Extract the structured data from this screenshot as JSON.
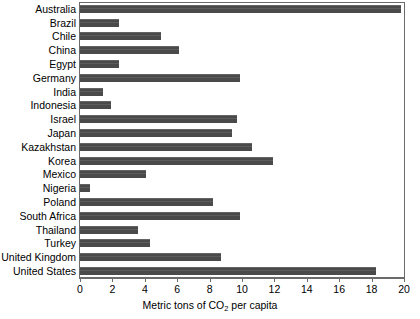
{
  "chart_data": {
    "type": "bar",
    "orientation": "horizontal",
    "title": "",
    "xlabel": "Metric tons of CO2 per capita",
    "xlabel_parts": {
      "before": "Metric tons of CO",
      "sub": "2",
      "after": " per capita"
    },
    "ylabel": "",
    "xlim": [
      0,
      20
    ],
    "xticks": [
      0,
      2,
      4,
      6,
      8,
      10,
      12,
      14,
      16,
      18,
      20
    ],
    "xtick_labels": [
      "0",
      "2",
      "4",
      "6",
      "8",
      "10",
      "12",
      "14",
      "16",
      "18",
      "20"
    ],
    "grid": false,
    "legend": "none",
    "bar_color": "#4a4a4a",
    "axis_color": "#6b6b6b",
    "categories": [
      "Australia",
      "Brazil",
      "Chile",
      "China",
      "Egypt",
      "Germany",
      "India",
      "Indonesia",
      "Israel",
      "Japan",
      "Kazakhstan",
      "Korea",
      "Mexico",
      "Nigeria",
      "Poland",
      "South Africa",
      "Thailand",
      "Turkey",
      "United Kingdom",
      "United States"
    ],
    "values": [
      19.8,
      2.4,
      5.0,
      6.1,
      2.4,
      9.9,
      1.4,
      1.9,
      9.7,
      9.4,
      10.6,
      11.9,
      4.1,
      0.6,
      8.2,
      9.9,
      3.6,
      4.3,
      8.7,
      18.3
    ]
  }
}
